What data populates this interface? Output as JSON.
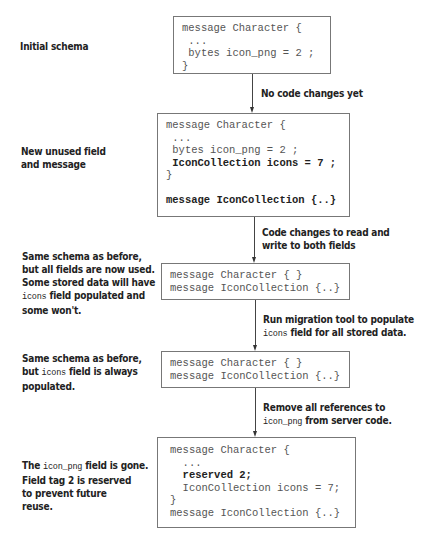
{
  "stages": [
    {
      "label_lines": [
        "Initial schema"
      ],
      "code_lines": [
        {
          "text": "message Character {",
          "bold": false
        },
        {
          "text": " ...",
          "bold": false
        },
        {
          "text": " bytes icon_png = 2 ;",
          "bold": false
        },
        {
          "text": "}",
          "bold": false
        }
      ]
    },
    {
      "label_lines": [
        "New unused field",
        "and message"
      ],
      "code_lines": [
        {
          "text": "message Character {",
          "bold": false
        },
        {
          "text": " ...",
          "bold": false
        },
        {
          "text": " bytes icon_png = 2 ;",
          "bold": false
        },
        {
          "text": " IconCollection icons = 7 ;",
          "bold": true
        },
        {
          "text": "}",
          "bold": false
        },
        {
          "text": "",
          "bold": false
        },
        {
          "text": "message IconCollection {..}",
          "bold": true
        }
      ]
    },
    {
      "label_lines": [
        "Same schema as before,",
        "but all fields are now used.",
        "Some stored data will have",
        "{icons} field populated and",
        "some won't."
      ],
      "code_lines": [
        {
          "text": "message Character { }",
          "bold": false
        },
        {
          "text": "message IconCollection {..}",
          "bold": false
        }
      ]
    },
    {
      "label_lines": [
        "Same schema as before,",
        "but {icons} field is always",
        "populated."
      ],
      "code_lines": [
        {
          "text": "message Character { }",
          "bold": false
        },
        {
          "text": "message IconCollection {..}",
          "bold": false
        }
      ]
    },
    {
      "label_lines": [
        "The {icon_png} field is gone.",
        "Field tag 2 is reserved",
        "to prevent future",
        "reuse."
      ],
      "code_lines": [
        {
          "text": "message Character {",
          "bold": false
        },
        {
          "text": "  ...",
          "bold": false
        },
        {
          "text": "  reserved 2;",
          "bold": true
        },
        {
          "text": "  IconCollection icons = 7;",
          "bold": false
        },
        {
          "text": "}",
          "bold": false
        },
        {
          "text": "message IconCollection {..}",
          "bold": false
        }
      ]
    }
  ],
  "transitions": [
    {
      "lines": [
        "No code changes yet"
      ]
    },
    {
      "lines": [
        "Code changes to read and",
        "write to both fields"
      ]
    },
    {
      "lines": [
        "Run migration tool to populate",
        "{icons} field for all stored data."
      ]
    },
    {
      "lines": [
        "Remove all references to",
        "{icon_png} from server code."
      ]
    }
  ],
  "colors": {
    "box_border": "#777777",
    "arrow": "#333333",
    "label_text": "#222222",
    "code_text": "#555555"
  }
}
